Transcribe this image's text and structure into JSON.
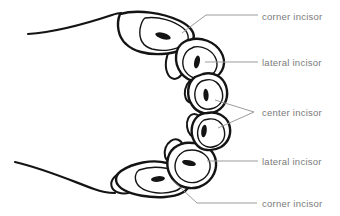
{
  "diagram": {
    "background": "#ffffff",
    "ink": "#141414",
    "leader_color": "#9b9b9b",
    "label_color": "#7a7a7a",
    "labels": [
      {
        "id": "corner-incisor-top",
        "text": "corner incisor"
      },
      {
        "id": "lateral-incisor-top",
        "text": "lateral incisor"
      },
      {
        "id": "center-incisor",
        "text": "center incisor"
      },
      {
        "id": "lateral-incisor-bottom",
        "text": "lateral incisor"
      },
      {
        "id": "corner-incisor-bottom",
        "text": "corner incisor"
      }
    ]
  }
}
